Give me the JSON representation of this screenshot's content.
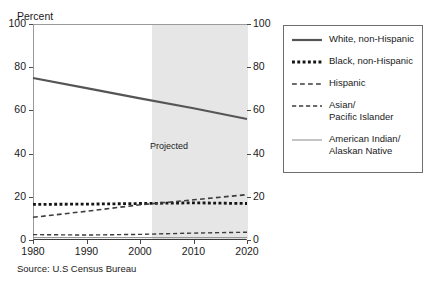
{
  "figure": {
    "source_note": "Source: U.S Census Bureau",
    "projected_label": "Projected"
  },
  "chart_data": {
    "type": "line",
    "title": "",
    "subtitle": "",
    "xlabel": "",
    "ylabel": "Percent",
    "xlim": [
      1980,
      2020
    ],
    "ylim": [
      0,
      100
    ],
    "grid": false,
    "legend_position": "right",
    "x_ticks": [
      1980,
      1990,
      2000,
      2010,
      2020
    ],
    "x_tick_labels": [
      "1980",
      "1990",
      "2000",
      "2010",
      "2020"
    ],
    "y_ticks": [
      0,
      20,
      40,
      60,
      80,
      100
    ],
    "y_tick_labels": [
      "0",
      "20",
      "40",
      "60",
      "80",
      "100"
    ],
    "y_ticks_right": [
      0,
      20,
      40,
      60,
      80,
      100
    ],
    "y_tick_labels_right": [
      "0",
      "20",
      "40",
      "60",
      "80",
      "100"
    ],
    "annotations": [
      {
        "text": "Projected",
        "x": 2006,
        "y": 43,
        "shaded_region": {
          "x_start": 2002,
          "x_end": 2020,
          "color": "#e6e6e6"
        }
      }
    ],
    "x": [
      1980,
      1990,
      2000,
      2010,
      2020
    ],
    "series": [
      {
        "name": "White, non-Hispanic",
        "values": [
          75.0,
          70.3,
          65.6,
          61.0,
          56.0
        ],
        "style": "solid",
        "width": 2.2,
        "color": "#555555"
      },
      {
        "name": "Black, non-Hispanic",
        "values": [
          16.5,
          16.6,
          16.9,
          17.2,
          16.9
        ],
        "style": "dotted",
        "width": 2.8,
        "color": "#151515"
      },
      {
        "name": "Hispanic",
        "values": [
          10.5,
          13.3,
          16.3,
          18.6,
          21.0
        ],
        "style": "dashed",
        "width": 1.6,
        "color": "#3d3d3d"
      },
      {
        "name": "Asian/\nPacific Islander",
        "values": [
          2.5,
          2.3,
          2.6,
          3.2,
          3.6
        ],
        "style": "dashed",
        "width": 1.4,
        "color": "#3d3d3d"
      },
      {
        "name": "American Indian/\nAlaskan Native",
        "values": [
          1.1,
          1.1,
          1.1,
          1.1,
          1.1
        ],
        "style": "solid",
        "width": 1.0,
        "color": "#8a8a8a"
      }
    ],
    "legend_entries": [
      {
        "label": "White, non-Hispanic",
        "style": "solid",
        "width": 2.2,
        "color": "#555555"
      },
      {
        "label": "Black, non-Hispanic",
        "style": "dotted",
        "width": 2.8,
        "color": "#151515"
      },
      {
        "label": "Hispanic",
        "style": "dashed",
        "width": 1.6,
        "color": "#3d3d3d"
      },
      {
        "label": "Asian/\nPacific Islander",
        "style": "dashed",
        "width": 1.4,
        "color": "#3d3d3d"
      },
      {
        "label": "American Indian/\nAlaskan Native",
        "style": "solid",
        "width": 1.0,
        "color": "#8a8a8a"
      }
    ]
  }
}
